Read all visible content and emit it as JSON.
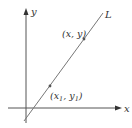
{
  "diagram": {
    "axes": {
      "x_label": "x",
      "y_label": "y"
    },
    "line": {
      "label": "L"
    },
    "points": [
      {
        "id": "general",
        "label": "(x, y)"
      },
      {
        "id": "fixed",
        "label_base_x": "(x",
        "sub1": "1",
        "label_sep": ", y",
        "sub2": "1",
        "label_end": ")"
      }
    ],
    "colors": {
      "axis": "#555555",
      "line": "#777777",
      "text": "#333333",
      "background": "#ffffff"
    }
  }
}
